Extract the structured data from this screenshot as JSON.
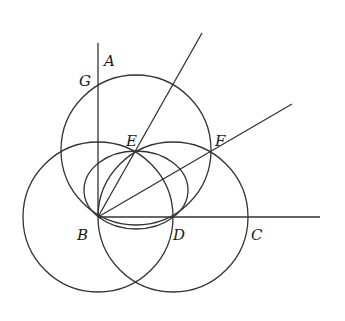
{
  "diagram": {
    "type": "geometric-construction",
    "colors": {
      "stroke": "#333333",
      "label": "#1a1a1a",
      "background": "#ffffff"
    },
    "points": {
      "A": {
        "label": "A",
        "x": 98,
        "y": 43
      },
      "G": {
        "label": "G",
        "x": 98,
        "y": 83
      },
      "B": {
        "label": "B",
        "x": 98,
        "y": 217
      },
      "D": {
        "label": "D",
        "x": 174,
        "y": 217
      },
      "C": {
        "label": "C",
        "x": 247,
        "y": 217
      },
      "E": {
        "label": "E",
        "x": 136,
        "y": 151
      },
      "F": {
        "label": "F",
        "x": 210,
        "y": 152
      }
    },
    "labels": [
      {
        "text": "A",
        "x": 104,
        "y": 66
      },
      {
        "text": "G",
        "x": 79,
        "y": 86
      },
      {
        "text": "E",
        "x": 126,
        "y": 146
      },
      {
        "text": "F",
        "x": 215,
        "y": 146
      },
      {
        "text": "B",
        "x": 77,
        "y": 240
      },
      {
        "text": "D",
        "x": 173,
        "y": 240
      },
      {
        "text": "C",
        "x": 251,
        "y": 240
      }
    ],
    "segments": [
      {
        "name": "ray-BA",
        "x1": 98,
        "y1": 217,
        "x2": 98,
        "y2": 43
      },
      {
        "name": "ray-BC",
        "x1": 98,
        "y1": 217,
        "x2": 320,
        "y2": 217
      },
      {
        "name": "ray-BE",
        "x1": 98,
        "y1": 217,
        "x2": 202,
        "y2": 33
      },
      {
        "name": "ray-BF",
        "x1": 98,
        "y1": 217,
        "x2": 292,
        "y2": 104
      }
    ],
    "circles": [
      {
        "name": "circle-center-B",
        "cx": 98,
        "cy": 217,
        "r": 75
      },
      {
        "name": "circle-center-D",
        "cx": 173,
        "cy": 217,
        "r": 75
      },
      {
        "name": "circle-center-E",
        "cx": 136,
        "cy": 150,
        "r": 75
      }
    ],
    "ellipses": [
      {
        "name": "arc-BED",
        "cx": 136,
        "cy": 190,
        "rx": 52,
        "ry": 39
      }
    ]
  }
}
